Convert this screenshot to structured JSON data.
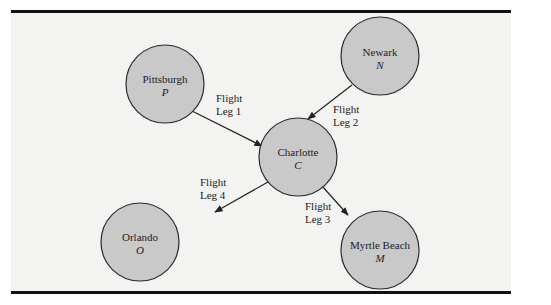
{
  "diagram": {
    "nodes": [
      {
        "id": "P",
        "name": "Pittsburgh",
        "symbol": "P",
        "cx": 165,
        "cy": 84
      },
      {
        "id": "N",
        "name": "Newark",
        "symbol": "N",
        "cx": 380,
        "cy": 56
      },
      {
        "id": "C",
        "name": "Charlotte",
        "symbol": "C",
        "cx": 298,
        "cy": 157
      },
      {
        "id": "O",
        "name": "Orlando",
        "symbol": "O",
        "cx": 140,
        "cy": 242
      },
      {
        "id": "M",
        "name": "Myrtle Beach",
        "symbol": "M",
        "cx": 380,
        "cy": 250
      }
    ],
    "edges": [
      {
        "from": "P",
        "to": "C",
        "label_line1": "Flight",
        "label_line2": "Leg 1"
      },
      {
        "from": "N",
        "to": "C",
        "label_line1": "Flight",
        "label_line2": "Leg 2"
      },
      {
        "from": "C",
        "to": "M",
        "label_line1": "Flight",
        "label_line2": "Leg 3"
      },
      {
        "from": "C",
        "to": "O",
        "label_line1": "Flight",
        "label_line2": "Leg 4"
      }
    ],
    "colors": {
      "node_fill": "#c9c9c9",
      "node_stroke": "#2a2a2a",
      "panel_bg": "#f3f3f1",
      "rule": "#111111"
    }
  }
}
